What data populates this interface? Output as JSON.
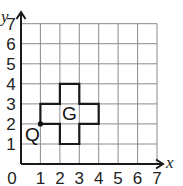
{
  "diagram": {
    "type": "coordinate-grid",
    "x_axis": {
      "label": "x",
      "min": 0,
      "max": 7,
      "ticks": [
        "0",
        "1",
        "2",
        "3",
        "4",
        "5",
        "6",
        "7"
      ]
    },
    "y_axis": {
      "label": "y",
      "min": 0,
      "max": 7,
      "ticks": [
        "1",
        "2",
        "3",
        "4",
        "5",
        "6",
        "7"
      ]
    },
    "shape": {
      "name": "G",
      "vertices": [
        [
          1,
          2
        ],
        [
          1,
          3
        ],
        [
          2,
          3
        ],
        [
          2,
          4
        ],
        [
          3,
          4
        ],
        [
          3,
          3
        ],
        [
          4,
          3
        ],
        [
          4,
          2
        ],
        [
          3,
          2
        ],
        [
          3,
          1
        ],
        [
          2,
          1
        ],
        [
          2,
          2
        ]
      ],
      "label_position": [
        2.5,
        2.5
      ]
    },
    "point": {
      "name": "Q",
      "coords": [
        1,
        2
      ]
    }
  },
  "colors": {
    "grid": "#8a8a8a",
    "axis": "#1a1a1a",
    "shape": "#1a1a1a"
  }
}
